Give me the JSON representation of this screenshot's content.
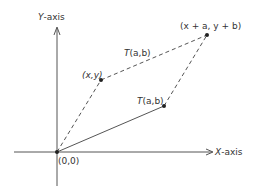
{
  "diagram": {
    "type": "vector-translation",
    "colors": {
      "line": "#555555",
      "point": "#222222",
      "text": "#333333",
      "background": "#ffffff"
    },
    "axes": {
      "x_label_prefix": "X",
      "x_label_suffix": "-axis",
      "y_label_prefix": "Y",
      "y_label_suffix": "-axis"
    },
    "points": {
      "origin": {
        "label": "(0,0)"
      },
      "xy": {
        "label": "(x,y)"
      },
      "translated": {
        "label": "(x + a, y + b)"
      },
      "ab": {
        "label_prefix": "T",
        "label_suffix": "(a,b)"
      }
    },
    "edges": {
      "top": {
        "label_prefix": "T",
        "label_suffix": "(a,b)",
        "style": "dashed"
      },
      "bottom": {
        "label_prefix": "T",
        "label_suffix": "(a,b)",
        "style": "solid"
      },
      "left": {
        "style": "dashed"
      },
      "right": {
        "style": "dashed"
      }
    }
  }
}
